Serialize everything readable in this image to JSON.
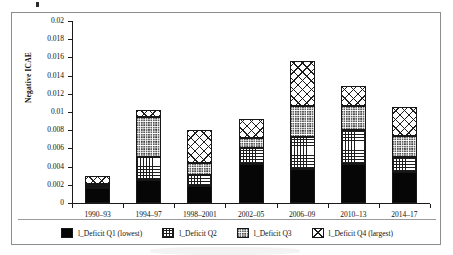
{
  "chart_data": {
    "type": "bar",
    "subtype": "stacked",
    "title": "",
    "xlabel": "",
    "ylabel": "Negative ICAE",
    "ylim": [
      0,
      0.02
    ],
    "ytick_step": 0.002,
    "grid": false,
    "legend_position": "bottom",
    "categories": [
      "1990–93",
      "1994–97",
      "1998–2001",
      "2002–05",
      "2006–09",
      "2010–13",
      "2014–17"
    ],
    "ytick_labels": [
      "0.02",
      "0.018",
      "0.016",
      "0.014",
      "0.012",
      "0.01",
      "0.008",
      "0.006",
      "0.004",
      "0.002",
      "0"
    ],
    "ytick_values": [
      0.02,
      0.018,
      0.016,
      0.014,
      0.012,
      0.01,
      0.008,
      0.006,
      0.004,
      0.002,
      0
    ],
    "series": [
      {
        "name": "l_Deficit Q1 (lowest)",
        "pattern": "solid-black",
        "values": [
          0.0016,
          0.0025,
          0.0019,
          0.0043,
          0.0037,
          0.0043,
          0.0034
        ]
      },
      {
        "name": "l_Deficit Q2",
        "pattern": "square-grid",
        "values": [
          0.0003,
          0.0026,
          0.0012,
          0.0018,
          0.0036,
          0.0037,
          0.0017
        ]
      },
      {
        "name": "l_Deficit Q3",
        "pattern": "dense-dot",
        "values": [
          0.0002,
          0.0044,
          0.0013,
          0.001,
          0.0034,
          0.0027,
          0.0023
        ]
      },
      {
        "name": "l_Deficit Q4 (largest)",
        "pattern": "diagonal-lattice",
        "values": [
          0.0009,
          0.0007,
          0.0036,
          0.0021,
          0.0049,
          0.0022,
          0.0031
        ]
      }
    ],
    "totals": [
      0.003,
      0.0102,
      0.008,
      0.0092,
      0.0156,
      0.0129,
      0.0105
    ]
  },
  "legend": {
    "items": [
      {
        "label": "l_Deficit Q1 (lowest)"
      },
      {
        "label": "l_Deficit Q2"
      },
      {
        "label": "l_Deficit Q3"
      },
      {
        "label": "l_Deficit Q4 (largest)"
      }
    ]
  },
  "colors": {
    "axis": "#1a1a1a",
    "frame": "#8d8d8d",
    "bar_outline": "#171717",
    "q1_fill": "#060606",
    "pattern_ink": "#1d1d1d",
    "background": "#ffffff"
  }
}
